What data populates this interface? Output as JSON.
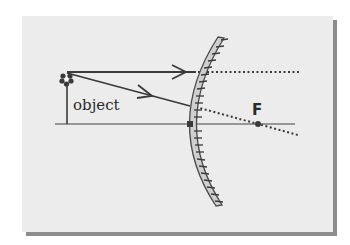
{
  "diagram": {
    "type": "optics-ray-diagram",
    "labels": {
      "object": "object",
      "focal_point": "F"
    },
    "colors": {
      "background": "#ececec",
      "shadow": "#8c8c8c",
      "ray": "#3a3a3a",
      "axis": "#7a7a7a",
      "mirror_face": "#c8c8c8",
      "mirror_edge": "#4a4a4a"
    },
    "elements": [
      {
        "id": "principal-axis",
        "kind": "line"
      },
      {
        "id": "object",
        "kind": "arrow-with-flower",
        "label": "object"
      },
      {
        "id": "ray-parallel",
        "kind": "ray",
        "note": "parallel to axis, reflects appearing to come from F"
      },
      {
        "id": "ray-toward-f",
        "kind": "ray",
        "note": "aimed toward F, dotted extension to F"
      },
      {
        "id": "convex-mirror",
        "kind": "mirror",
        "hatched_side": "right"
      },
      {
        "id": "focal-point",
        "kind": "point",
        "label": "F"
      },
      {
        "id": "mirror-vertex",
        "kind": "point"
      }
    ]
  }
}
